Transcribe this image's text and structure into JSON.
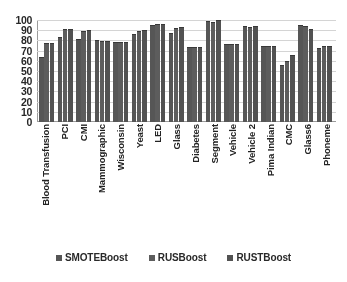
{
  "chart_data": {
    "type": "bar",
    "title": "",
    "xlabel": "",
    "ylabel": "",
    "ylim": [
      0,
      100
    ],
    "yticks": [
      100,
      90,
      80,
      70,
      60,
      50,
      40,
      30,
      20,
      10,
      0
    ],
    "grid": true,
    "legend_position": "bottom",
    "categories": [
      "Blood Transfusion",
      "PCI",
      "CMI",
      "Mammographic",
      "Wisconsin",
      "Yeast",
      "LED",
      "Glass",
      "Diabetes",
      "Segment",
      "Vehicle",
      "Vehicle 2",
      "Pima Indian",
      "CMC",
      "Glass6",
      "Phoneme"
    ],
    "series": [
      {
        "name": "SMOTEBoost",
        "color": "#575757",
        "values": [
          64,
          83,
          81,
          80,
          78,
          86,
          95,
          87,
          74,
          99,
          76,
          94,
          75,
          56,
          95,
          73
        ]
      },
      {
        "name": "RUSBoost",
        "color": "#5e5e5e",
        "values": [
          77,
          91,
          89,
          79,
          78,
          89,
          96,
          92,
          74,
          98,
          76,
          93,
          75,
          60,
          94,
          75
        ]
      },
      {
        "name": "RUSTBoost",
        "color": "#535353",
        "values": [
          77,
          91,
          90,
          79,
          78,
          90,
          96,
          93,
          74,
          100,
          76,
          94,
          75,
          66,
          91,
          75
        ]
      }
    ]
  },
  "legend": {
    "items": [
      {
        "label": "SMOTEBoost"
      },
      {
        "label": "RUSBoost"
      },
      {
        "label": "RUSTBoost"
      }
    ]
  }
}
